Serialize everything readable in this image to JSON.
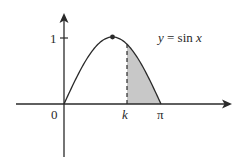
{
  "diagram": {
    "type": "function-graph",
    "function_label": "y = sin x",
    "function_label_parts": {
      "y": "y",
      "eq": " = sin ",
      "x": "x"
    },
    "axes": {
      "origin_label": "0",
      "y_tick_label": "1",
      "x_labels": [
        {
          "id": "k",
          "text": "k",
          "italic": true
        },
        {
          "id": "pi",
          "text": "π",
          "italic": false
        }
      ]
    },
    "features": {
      "max_point": "dot at maximum of curve (x = π/2, y = 1)",
      "dashed_line": "vertical dashed line from x = k up to the curve",
      "shaded_region": "region under y = sin x between x = k and x = π"
    },
    "colors": {
      "stroke": "#2a2a2a",
      "shade": "#c8c8c8",
      "background": "#ffffff"
    }
  }
}
